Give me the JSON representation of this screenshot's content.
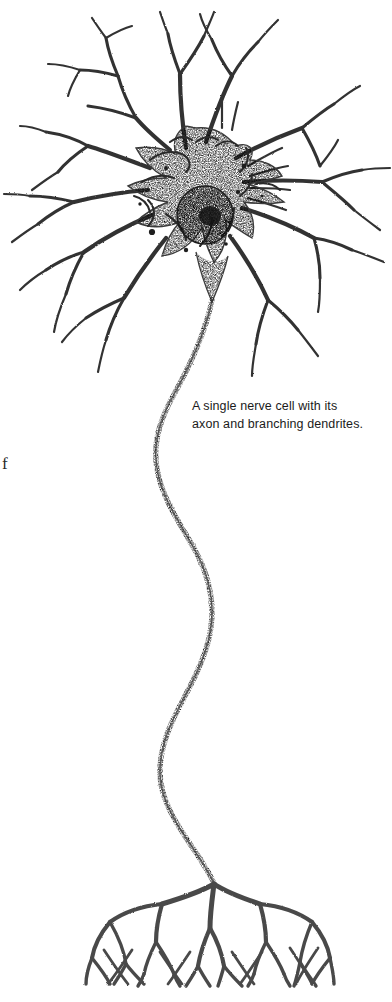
{
  "figure": {
    "name": "neuron-illustration",
    "style": "stipple / engraving line art",
    "background_color": "#ffffff",
    "ink_color": "#2b2b2b",
    "caption": {
      "line1": "A single nerve cell with its",
      "line2": "axon and branching dendrites."
    },
    "margin_fragment": "f",
    "parts": {
      "soma_label": "cell body",
      "nucleus_label": "nucleus",
      "dendrites_label": "dendrites",
      "axon_label": "axon",
      "terminals_label": "axon terminals"
    }
  }
}
